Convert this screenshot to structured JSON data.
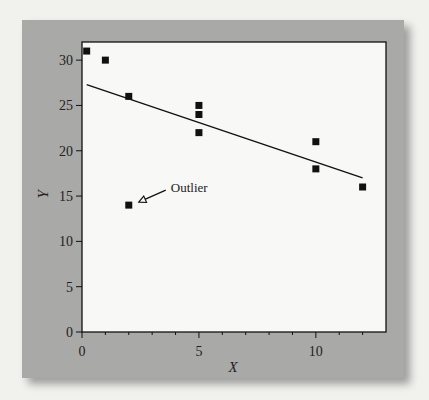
{
  "chart_data": {
    "type": "scatter",
    "title": "",
    "xlabel": "X",
    "ylabel": "Y",
    "xlim": [
      0,
      13
    ],
    "ylim": [
      0,
      32
    ],
    "x_ticks": [
      0,
      5,
      10
    ],
    "x_minor_ticks": [
      1,
      2,
      3,
      4,
      6,
      7,
      8,
      9,
      11,
      12
    ],
    "y_ticks": [
      0,
      5,
      10,
      15,
      20,
      25,
      30
    ],
    "grid": false,
    "legend": null,
    "series": [
      {
        "name": "data",
        "marker": "square",
        "color": "#111111",
        "points": [
          {
            "x": 0.2,
            "y": 31
          },
          {
            "x": 1,
            "y": 30
          },
          {
            "x": 2,
            "y": 26
          },
          {
            "x": 2,
            "y": 14
          },
          {
            "x": 5,
            "y": 25
          },
          {
            "x": 5,
            "y": 24
          },
          {
            "x": 5,
            "y": 22
          },
          {
            "x": 10,
            "y": 21
          },
          {
            "x": 10,
            "y": 18
          },
          {
            "x": 12,
            "y": 16
          }
        ]
      }
    ],
    "fit_line": {
      "x1": 0.2,
      "y1": 27.3,
      "x2": 12,
      "y2": 17.0
    },
    "annotations": [
      {
        "text": "Outlier",
        "target": {
          "x": 2,
          "y": 14
        },
        "arrow": "open-triangle"
      }
    ]
  },
  "colors": {
    "background": "#f1f1ee",
    "panel": "#a9a9a7",
    "plot_area": "#f8f8f6",
    "ink": "#111111"
  }
}
